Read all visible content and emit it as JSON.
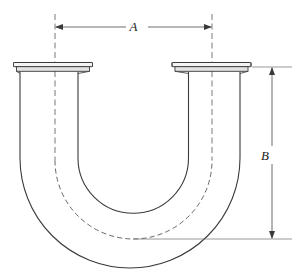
{
  "figure": {
    "type": "engineering-dimension-drawing",
    "background_color": "#ffffff",
    "line_color": "#3a3a3a"
  },
  "dimensions": [
    {
      "id": "A",
      "label": "A",
      "orientation": "horizontal",
      "description": "center-to-center distance between the two tube legs",
      "from_px": 55,
      "to_px": 212,
      "axis_px": 27
    },
    {
      "id": "B",
      "label": "B",
      "orientation": "vertical",
      "description": "height from flange face to bend centerline tangent",
      "from_px": 67,
      "to_px": 239,
      "axis_px": 272
    }
  ],
  "parts": {
    "left_flange_label": "left-flange",
    "right_flange_label": "right-flange",
    "left_leg_label": "left-leg",
    "right_leg_label": "right-leg",
    "bend_label": "u-bend",
    "centerline_label": "tube-centerline"
  }
}
